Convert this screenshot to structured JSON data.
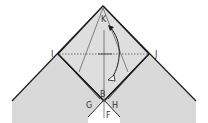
{
  "diagram": {
    "type": "origami-fold-step",
    "labels": {
      "K": "K",
      "I": "I",
      "J": "J",
      "B": "B",
      "G": "G",
      "H": "H",
      "F": "F"
    },
    "colors": {
      "paper": "#d9d9d9",
      "paper_inner": "#dedede",
      "edge": "#1a1a1a",
      "crease": "#555555",
      "background": "#ffffff"
    },
    "annotations": {
      "valley_fold_line": "I-J dotted",
      "fold_arrow": "curved arrow from K down to B"
    }
  }
}
